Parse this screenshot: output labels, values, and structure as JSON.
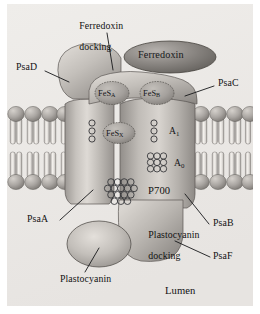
{
  "figure": {
    "background_color": "#ffffff",
    "panel_color": "#eceae7"
  },
  "labels": {
    "ferredoxin_docking_line1": "Ferredoxin",
    "ferredoxin_docking_line2": "docking",
    "ferredoxin": "Ferredoxin",
    "psa_d": "PsaD",
    "psa_c": "PsaC",
    "psa_a": "PsaA",
    "psa_b": "PsaB",
    "psa_f": "PsaF",
    "p700": "P700",
    "plastocyanin_docking_line1": "Plastocyanin",
    "plastocyanin_docking_line2": "docking",
    "plastocyanin": "Plastocyanin",
    "lumen": "Lumen"
  },
  "cofactors": [
    {
      "name": "FeS_A",
      "base": "FeS",
      "sub": "A"
    },
    {
      "name": "FeS_B",
      "base": "FeS",
      "sub": "B"
    },
    {
      "name": "FeS_X",
      "base": "FeS",
      "sub": "X"
    },
    {
      "name": "A_1",
      "base": "A",
      "sub": "1"
    },
    {
      "name": "A_0",
      "base": "A",
      "sub": "0"
    }
  ],
  "colors": {
    "protein_fill": "#b9b5b0",
    "protein_fill_light": "#d6d2cd",
    "protein_stroke": "#55524e",
    "ferredoxin_fill": "#8f8b87",
    "membrane_head": "#a8a4a0",
    "membrane_tail": "#efece8",
    "leader_line": "#16171a",
    "text": "#111111"
  }
}
